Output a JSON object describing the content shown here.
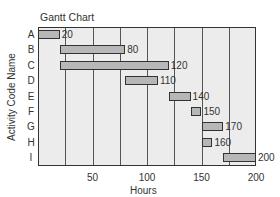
{
  "chart_data": {
    "type": "gantt",
    "title": "Gantt Chart",
    "xlabel": "Hours",
    "ylabel": "Activity Code Name",
    "xlim": [
      0,
      200
    ],
    "xticks": [
      50,
      100,
      150,
      200
    ],
    "grid_x_step": 25,
    "categories": [
      "A",
      "B",
      "C",
      "D",
      "E",
      "F",
      "G",
      "H",
      "I"
    ],
    "tasks": [
      {
        "name": "A",
        "start": 0,
        "end": 20,
        "label": "20"
      },
      {
        "name": "B",
        "start": 20,
        "end": 80,
        "label": "80"
      },
      {
        "name": "C",
        "start": 20,
        "end": 120,
        "label": "120"
      },
      {
        "name": "D",
        "start": 80,
        "end": 110,
        "label": "110"
      },
      {
        "name": "E",
        "start": 120,
        "end": 140,
        "label": "140"
      },
      {
        "name": "F",
        "start": 140,
        "end": 150,
        "label": "150"
      },
      {
        "name": "G",
        "start": 150,
        "end": 170,
        "label": "170"
      },
      {
        "name": "H",
        "start": 150,
        "end": 160,
        "label": "160"
      },
      {
        "name": "I",
        "start": 170,
        "end": 200,
        "label": "200"
      }
    ],
    "colors": {
      "bar": "#b7b7b7",
      "background": "#ececec",
      "border": "#333333"
    }
  }
}
